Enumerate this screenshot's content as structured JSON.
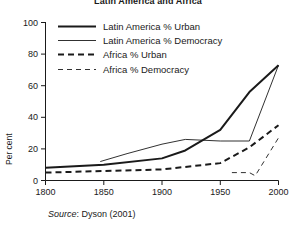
{
  "figure": {
    "title": "Latin America and Africa",
    "source_prefix": "Source",
    "source_text": ": Dyson (2001)",
    "background": "#ffffff",
    "line_color": "#1a1a1a"
  },
  "chart_data": {
    "type": "line",
    "title": "Latin America and Africa",
    "xlabel": "",
    "ylabel": "Per cent",
    "xlim": [
      1800,
      2000
    ],
    "ylim": [
      0,
      100
    ],
    "xticks": [
      1800,
      1850,
      1900,
      1950,
      2000
    ],
    "yticks": [
      0,
      20,
      40,
      60,
      80,
      100
    ],
    "xtick_labels": [
      "1800",
      "1850",
      "1900",
      "1950",
      "2000"
    ],
    "ytick_labels": [
      "0",
      "20",
      "40",
      "60",
      "80",
      "100"
    ],
    "grid": false,
    "legend_position": "top-left-inside",
    "series": [
      {
        "name": "Latin America % Urban",
        "style": "solid",
        "width": "thick",
        "x": [
          1800,
          1850,
          1900,
          1920,
          1950,
          1975,
          2000
        ],
        "y": [
          8,
          10,
          14,
          19,
          32,
          56,
          73
        ]
      },
      {
        "name": "Latin America % Democracy",
        "style": "solid",
        "width": "thin",
        "x": [
          1847,
          1870,
          1900,
          1920,
          1950,
          1975,
          2000
        ],
        "y": [
          12,
          17,
          23,
          26,
          25,
          25,
          73
        ]
      },
      {
        "name": "Africa % Urban",
        "style": "dashed",
        "width": "thick",
        "x": [
          1800,
          1850,
          1900,
          1950,
          1975,
          2000
        ],
        "y": [
          5,
          6,
          7,
          11,
          21,
          35
        ]
      },
      {
        "name": "Africa % Democracy",
        "style": "dashed",
        "width": "thin",
        "x": [
          1960,
          1975,
          1980,
          2000
        ],
        "y": [
          5,
          5,
          3,
          27
        ]
      }
    ]
  },
  "legend": {
    "entries": [
      {
        "label": "Latin America % Urban",
        "style": "solid",
        "width": "thick"
      },
      {
        "label": "Latin America % Democracy",
        "style": "solid",
        "width": "thin"
      },
      {
        "label": "Africa % Urban",
        "style": "dashed",
        "width": "thick"
      },
      {
        "label": "Africa % Democracy",
        "style": "dashed",
        "width": "thin"
      }
    ]
  }
}
